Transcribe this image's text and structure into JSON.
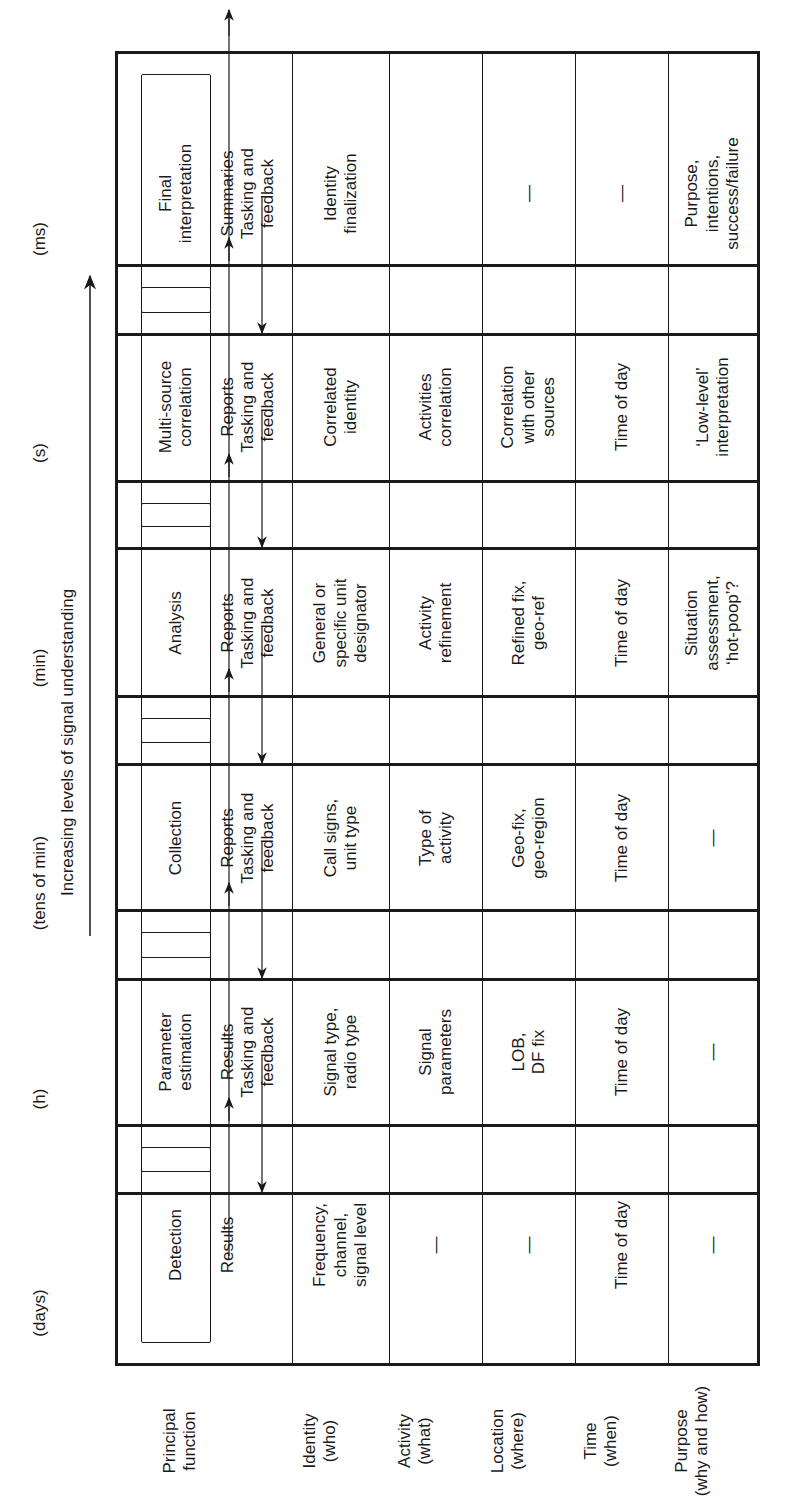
{
  "diagram": {
    "axis_label": "Increasing levels of signal understanding",
    "row_labels": [
      "Principal\nfunction",
      "Identity\n(who)",
      "Activity\n(what)",
      "Location\n(where)",
      "Time\n(when)",
      "Purpose\n(why and how)"
    ],
    "stages": [
      {
        "time_scale": "(ms)",
        "function": "Detection",
        "output": "Results",
        "input": "",
        "identity": "Frequency,\nchannel,\nsignal level",
        "activity": "—",
        "location": "—",
        "time": "Time of day",
        "purpose": "—"
      },
      {
        "time_scale": "(s)",
        "function": "Parameter\nestimation",
        "output": "Results",
        "input": "Tasking and\nfeedback",
        "identity": "Signal type,\nradio type",
        "activity": "Signal\nparameters",
        "location": "LOB,\nDF fix",
        "time": "Time of day",
        "purpose": "—"
      },
      {
        "time_scale": "(min)",
        "function": "Collection",
        "output": "Reports",
        "input": "Tasking and\nfeedback",
        "identity": "Call signs,\nunit type",
        "activity": "Type of\nactivity",
        "location": "Geo-fix,\ngeo-region",
        "time": "Time of day",
        "purpose": "—"
      },
      {
        "time_scale": "(tens of min)",
        "function": "Analysis",
        "output": "Reports",
        "input": "Tasking and\nfeedback",
        "identity": "General or\nspecific unit\ndesignator",
        "activity": "Activity\nrefinement",
        "location": "Refined fix,\ngeo-ref",
        "time": "Time of day",
        "purpose": "Situation\nassessment,\n‘hot-poop’?"
      },
      {
        "time_scale": "(h)",
        "function": "Multi-source\ncorrelation",
        "output": "Reports",
        "input": "Tasking and\nfeedback",
        "identity": "Correlated\nidentity",
        "activity": "Activities\ncorrelation",
        "location": "Correlation\nwith other\nsources",
        "time": "Time of day",
        "purpose": "‘Low-level’\ninterpretation"
      },
      {
        "time_scale": "(days)",
        "function": "Final\ninterpretation",
        "output": "Summaries",
        "input": "Tasking and\nfeedback",
        "identity": "Identity\nfinalization",
        "activity": "",
        "location": "—",
        "time": "—",
        "purpose": "Purpose,\nintentions,\nsuccess/failure"
      }
    ]
  }
}
